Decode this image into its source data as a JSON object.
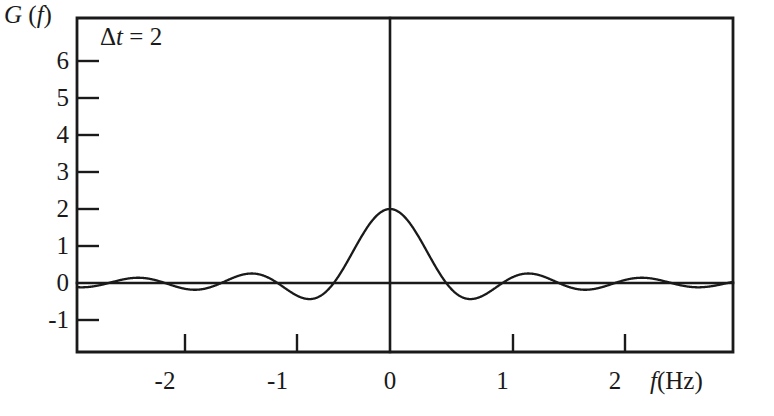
{
  "figure": {
    "background_color": "#ffffff",
    "ink_color": "#1a1a1a"
  },
  "axis_titles": {
    "y_symbol": "G",
    "y_arg": "(f)",
    "y_full": "G (f)",
    "x_symbol": "f",
    "x_unit": "(Hz)",
    "x_full": "f (Hz)"
  },
  "annotation": {
    "delta_symbol": "Δ",
    "delta_var": "t",
    "delta_eq": " = 2",
    "text": "Δt = 2",
    "value": 2
  },
  "y_axis": {
    "ticks": [
      6,
      5,
      4,
      3,
      2,
      1,
      0,
      -1
    ],
    "labels": [
      "6",
      "5",
      "4",
      "3",
      "2",
      "1",
      "0",
      "-1"
    ],
    "min": -1,
    "max": 6
  },
  "x_axis": {
    "ticks": [
      -2,
      -1,
      0,
      1,
      2
    ],
    "labels": [
      "-2",
      "-1",
      "0",
      "1",
      "2"
    ],
    "min": -2.75,
    "max": 3.0
  },
  "chart_data": {
    "type": "line",
    "title": "",
    "subtitle": "",
    "xlabel": "f (Hz)",
    "ylabel": "G (f)",
    "xlim": [
      -2.75,
      3.0
    ],
    "ylim": [
      -1.45,
      6.7
    ],
    "grid": false,
    "legend": null,
    "annotations": [
      {
        "text": "Δt = 2",
        "x": -2.25,
        "y": 5.9
      }
    ],
    "x_ticks": [
      -2,
      -1,
      0,
      1,
      2
    ],
    "x_tick_labels": [
      "-2",
      "-1",
      "0",
      "1",
      "2"
    ],
    "y_ticks": [
      6,
      5,
      4,
      3,
      2,
      1,
      0,
      -1
    ],
    "y_tick_labels": [
      "6",
      "5",
      "4",
      "3",
      "2",
      "1",
      "0",
      "-1"
    ],
    "function": "G(f) = Δt * sinc(Δt * f)",
    "parameters": {
      "delta_t": 2,
      "peak_value": 2,
      "first_zero_hz": 0.5
    },
    "series": [
      {
        "name": "G(f) = 2 sinc(2f)",
        "formula_note": "sinc(x) = sin(pi x)/(pi x)",
        "zero_crossings": [
          -2.5,
          -2.0,
          -1.5,
          -1.0,
          -0.5,
          0.5,
          1.0,
          1.5,
          2.0,
          2.5
        ],
        "key_points": [
          {
            "f": 0.0,
            "G": 2.0
          },
          {
            "f": 0.5,
            "G": 0.0
          },
          {
            "f": 0.72,
            "G": -0.43
          },
          {
            "f": 1.0,
            "G": 0.0
          },
          {
            "f": 1.23,
            "G": 0.25
          },
          {
            "f": 1.5,
            "G": 0.0
          },
          {
            "f": 1.74,
            "G": -0.18
          },
          {
            "f": 2.0,
            "G": 0.0
          },
          {
            "f": 2.24,
            "G": 0.14
          },
          {
            "f": 2.5,
            "G": 0.0
          },
          {
            "f": -0.72,
            "G": -0.43
          },
          {
            "f": -1.23,
            "G": 0.25
          },
          {
            "f": -1.74,
            "G": -0.18
          },
          {
            "f": -2.24,
            "G": 0.14
          }
        ]
      }
    ]
  }
}
